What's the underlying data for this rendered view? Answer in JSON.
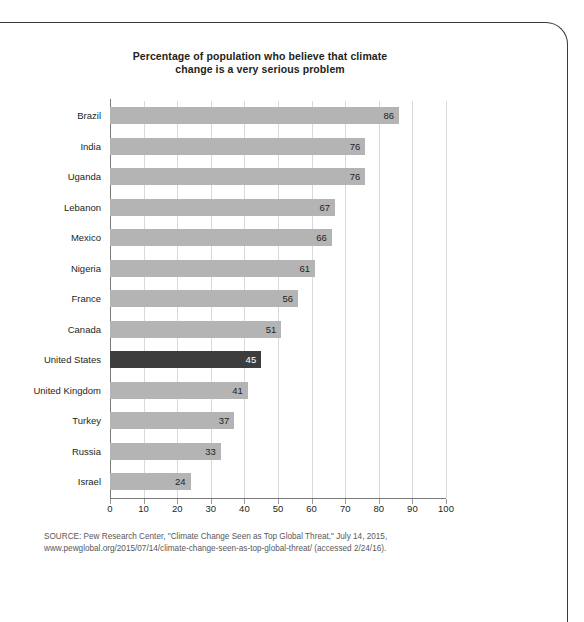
{
  "chart_data": {
    "type": "bar",
    "orientation": "horizontal",
    "title": "Percentage of population who believe that climate change is a very serious problem",
    "title_line1": "Percentage of population who believe that climate",
    "title_line2": "change is a very serious problem",
    "xlabel": "",
    "ylabel": "",
    "xlim": [
      0,
      100
    ],
    "xticks": [
      0,
      10,
      20,
      30,
      40,
      50,
      60,
      70,
      80,
      90,
      100
    ],
    "grid": "vertical",
    "legend": "none",
    "categories": [
      "Brazil",
      "India",
      "Uganda",
      "Lebanon",
      "Mexico",
      "Nigeria",
      "France",
      "Canada",
      "United States",
      "United Kingdom",
      "Turkey",
      "Russia",
      "Israel"
    ],
    "values": [
      86,
      76,
      76,
      67,
      66,
      61,
      56,
      51,
      45,
      41,
      37,
      33,
      24
    ],
    "highlight_category": "United States",
    "bar_color": "#b4b4b4",
    "highlight_color": "#3d3d3d",
    "gridline_color": "#d9d9d9",
    "axis_color": "#7a7a7a",
    "text_color": "#231f20"
  },
  "source": {
    "line1": "SOURCE: Pew Research Center, \"Climate Change Seen as Top Global Threat,\" July 14, 2015,",
    "line2": "www.pewglobal.org/2015/07/14/climate-change-seen-as-top-global-threat/ (accessed 2/24/16)."
  }
}
